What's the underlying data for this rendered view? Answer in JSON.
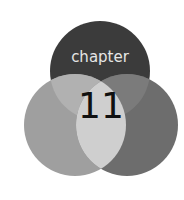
{
  "emblem": {
    "label": "chapter",
    "number": "11"
  },
  "colors": {
    "background": "#ffffff",
    "top_circle": "#3b3b3b",
    "left_circle": "#9f9f9f",
    "right_circle": "#6d6d6d",
    "top_left_overlap": "#b1b1b1",
    "top_right_overlap": "#7b7b7b",
    "left_right_overlap": "#cfcfcf",
    "label_text": "#e6e6e6",
    "number_text": "#111111"
  }
}
